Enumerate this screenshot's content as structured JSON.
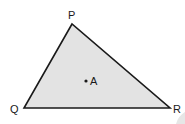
{
  "diagram": {
    "type": "triangle",
    "fill_color": "#e3e3e3",
    "stroke_color": "#1a1a1a",
    "vertices": [
      {
        "name": "P",
        "x": 72,
        "y": 24
      },
      {
        "name": "Q",
        "x": 24,
        "y": 108
      },
      {
        "name": "R",
        "x": 170,
        "y": 108
      }
    ],
    "labels": {
      "P": "P",
      "Q": "Q",
      "R": "R",
      "A": "A"
    },
    "point": {
      "name": "A",
      "x": 86,
      "y": 81
    }
  }
}
